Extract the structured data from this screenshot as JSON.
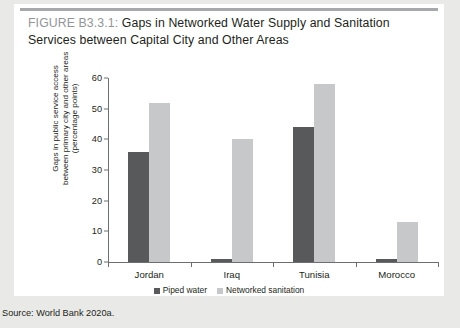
{
  "figure": {
    "tag": "FIGURE B3.3.1:",
    "title": "Gaps in Networked Water Supply and Sanitation Services between Capital City and Other Areas",
    "source": "Source: World Bank 2020a."
  },
  "colors": {
    "dark_series": "#58595b",
    "light_series": "#c7c8ca",
    "axis": "#6d6e71",
    "rule": "#a6a8ab",
    "text": "#231f20",
    "tag_text": "#939598",
    "panel": "#ffffff",
    "page": "#e9e9e7"
  },
  "chart_data": {
    "type": "bar",
    "title": "Gaps in Networked Water Supply and Sanitation Services between Capital City and Other Areas",
    "xlabel": "",
    "ylabel": "Gaps in public service access between primary city and other areas (percentage points)",
    "ylabel_lines": [
      "Gaps in public service access",
      "between primary city and other areas",
      "(percentage points)"
    ],
    "categories": [
      "Jordan",
      "Iraq",
      "Tunisia",
      "Morocco"
    ],
    "series": [
      {
        "name": "Piped water",
        "color": "#58595b",
        "values": [
          36,
          1,
          44,
          1
        ]
      },
      {
        "name": "Networked sanitation",
        "color": "#c7c8ca",
        "values": [
          52,
          40,
          58,
          13
        ]
      }
    ],
    "ylim": [
      0,
      60
    ],
    "yticks": [
      0,
      10,
      20,
      30,
      40,
      50,
      60
    ],
    "grid": false,
    "legend_position": "bottom"
  }
}
